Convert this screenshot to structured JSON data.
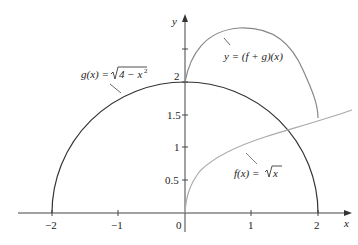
{
  "figure": {
    "axes": {
      "x_label": "x",
      "y_label": "y",
      "x_ticks": [
        "−2",
        "−1",
        "0",
        "1",
        "2"
      ],
      "y_ticks": [
        "0.5",
        "1",
        "1.5",
        "2"
      ],
      "origin_label": "0"
    },
    "curves": [
      {
        "name": "g",
        "label": "g(x) = √(4 − x²)",
        "color": "#333333"
      },
      {
        "name": "f",
        "label": "f(x) = √x",
        "color": "#aaaaaa"
      },
      {
        "name": "f_plus_g",
        "label": "y = (f + g)(x)",
        "color": "#888888"
      }
    ],
    "labels": {
      "g_prefix": "g(x) = ",
      "g_radicand": "4 − x",
      "g_exp": "2",
      "f_prefix": "f(x) = ",
      "f_radicand": "x",
      "sum": "y = (f + g)(x)"
    }
  }
}
